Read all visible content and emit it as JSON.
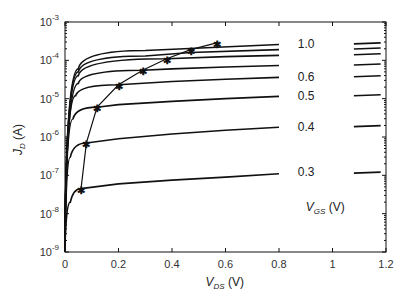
{
  "chart_data": {
    "type": "line",
    "title": "",
    "xlabel": "V_DS (V)",
    "ylabel": "J_D (A)",
    "xlim": [
      0,
      1.2
    ],
    "ylim": [
      1e-09,
      0.001
    ],
    "yscale": "log",
    "xticks": [
      "0",
      "0.2",
      "0.4",
      "0.6",
      "0.8",
      "1",
      "1.2"
    ],
    "yticks": [
      "10^-9",
      "10^-8",
      "10^-7",
      "10^-6",
      "10^-5",
      "10^-4",
      "10^-3"
    ],
    "grid": false,
    "legend_title": "V_GS (V)",
    "series_labels_shown": [
      "1.0",
      "0.6",
      "0.5",
      "0.4",
      "0.3"
    ],
    "series": [
      {
        "name": "V_GS=0.3",
        "x": [
          0,
          0.02,
          0.06,
          0.2,
          0.4,
          0.6,
          0.8
        ],
        "values": [
          1e-09,
          2e-08,
          4.5e-08,
          6e-08,
          7.5e-08,
          9e-08,
          1.1e-07
        ]
      },
      {
        "name": "V_GS=0.4",
        "x": [
          0,
          0.02,
          0.08,
          0.2,
          0.4,
          0.6,
          0.8
        ],
        "values": [
          1e-09,
          3e-07,
          7e-07,
          9e-07,
          1.2e-06,
          1.5e-06,
          1.8e-06
        ]
      },
      {
        "name": "V_GS=0.5",
        "x": [
          0,
          0.03,
          0.12,
          0.2,
          0.4,
          0.6,
          0.8
        ],
        "values": [
          1e-09,
          3e-06,
          6e-06,
          7e-06,
          8.5e-06,
          1e-05,
          1.15e-05
        ]
      },
      {
        "name": "V_GS=0.6",
        "x": [
          0,
          0.04,
          0.2,
          0.4,
          0.6,
          0.8
        ],
        "values": [
          1e-09,
          1.2e-05,
          2.3e-05,
          2.8e-05,
          3.2e-05,
          3.6e-05
        ]
      },
      {
        "name": "V_GS=0.7",
        "x": [
          0,
          0.05,
          0.29,
          0.4,
          0.6,
          0.8
        ],
        "values": [
          1e-09,
          2.5e-05,
          5.5e-05,
          6e-05,
          6.7e-05,
          7.3e-05
        ]
      },
      {
        "name": "V_GS=0.8",
        "x": [
          0,
          0.05,
          0.38,
          0.6,
          0.8
        ],
        "values": [
          1e-09,
          4e-05,
          0.00011,
          0.000125,
          0.000135
        ]
      },
      {
        "name": "V_GS=0.9",
        "x": [
          0,
          0.05,
          0.3,
          0.47,
          0.8
        ],
        "values": [
          1e-09,
          5e-05,
          0.00013,
          0.00016,
          0.00019
        ]
      },
      {
        "name": "V_GS=1.0",
        "x": [
          0,
          0.05,
          0.3,
          0.57,
          0.8
        ],
        "values": [
          1e-09,
          6e-05,
          0.00018,
          0.00022,
          0.00026
        ]
      }
    ],
    "saturation_locus": {
      "marker": "asterisk",
      "x": [
        0.06,
        0.08,
        0.12,
        0.2,
        0.29,
        0.38,
        0.47,
        0.57
      ],
      "values": [
        4.5e-08,
        7e-07,
        6e-06,
        2.3e-05,
        5.5e-05,
        0.00011,
        0.00019,
        0.00029
      ]
    },
    "annotations": [
      "1.0",
      "0.6",
      "0.5",
      "0.4",
      "0.3",
      "V_GS (V)"
    ]
  }
}
